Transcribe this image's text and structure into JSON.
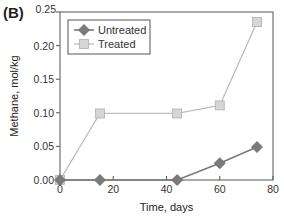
{
  "panel_label": "(B)",
  "chart_data": {
    "type": "line",
    "title": "",
    "xlabel": "Time, days",
    "ylabel": "Methane, mol/kg",
    "xlim": [
      0,
      80
    ],
    "ylim": [
      0,
      0.25
    ],
    "xticks": [
      0,
      20,
      40,
      60,
      80
    ],
    "xtick_labels": [
      "0",
      "20",
      "40",
      "60",
      "80"
    ],
    "yticks": [
      0,
      0.05,
      0.1,
      0.15,
      0.2,
      0.25
    ],
    "ytick_labels": [
      "0.00",
      "0.05",
      "0.10",
      "0.15",
      "0.20",
      "0.25"
    ],
    "grid": false,
    "legend_position": "upper left",
    "series": [
      {
        "name": "Untreated",
        "marker": "diamond",
        "color": "#7a7a7a",
        "x": [
          0,
          15,
          44,
          60,
          74
        ],
        "values": [
          0.0,
          0.0,
          0.0,
          0.025,
          0.049
        ]
      },
      {
        "name": "Treated",
        "marker": "square",
        "color": "#bdbdbd",
        "x": [
          0,
          15,
          44,
          60,
          74
        ],
        "values": [
          0.0,
          0.099,
          0.099,
          0.111,
          0.235
        ]
      }
    ]
  }
}
